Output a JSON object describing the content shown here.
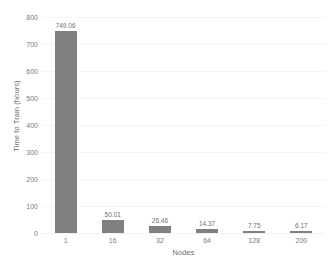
{
  "chart_data": {
    "type": "bar",
    "title": "",
    "subtitle": "",
    "xlabel": "Nodes",
    "ylabel": "Time to Train (hours)",
    "categories": [
      "1",
      "16",
      "32",
      "64",
      "128",
      "200"
    ],
    "values": [
      749.06,
      50.01,
      26.46,
      14.37,
      7.75,
      6.17
    ],
    "value_labels": [
      "749.06",
      "50.01",
      "26.46",
      "14.37",
      "7.75",
      "6.17"
    ],
    "series": [
      {
        "name": "Time to Train",
        "values": [
          749.06,
          50.01,
          26.46,
          14.37,
          7.75,
          6.17
        ]
      }
    ],
    "ylim": [
      0,
      800
    ],
    "ytick_labels": [
      "0",
      "100",
      "200",
      "300",
      "400",
      "500",
      "600",
      "700",
      "800"
    ],
    "ytick_values": [
      0,
      100,
      200,
      300,
      400,
      500,
      600,
      700,
      800
    ],
    "grid": true,
    "grid_axis": "y",
    "legend": false,
    "legend_position": "none",
    "bar_color": "#808080",
    "gridline_color": "#f4f5f7",
    "background_color": "#ffffff",
    "text_color": "#7a7a7a"
  }
}
